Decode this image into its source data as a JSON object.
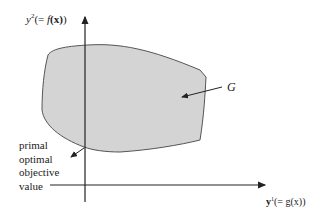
{
  "diagram": {
    "y_axis_label": {
      "prefix": "y",
      "superscript": "2",
      "rest": "(= ",
      "func": "f",
      "arg": "(x)",
      "close": ")"
    },
    "x_axis_label": {
      "prefix": "y",
      "superscript": "1",
      "rest": "(= g(x))"
    },
    "region_label": "G",
    "annotation_lines": [
      "primal",
      "optimal",
      "objective",
      "value"
    ],
    "colors": {
      "region_fill": "#d4d4d4",
      "region_stroke": "#555555",
      "axis": "#222222"
    }
  }
}
